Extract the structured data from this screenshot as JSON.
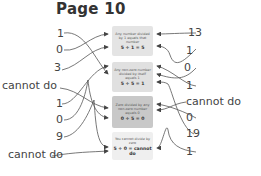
{
  "title": "Page 10",
  "boxes": [
    {
      "rule": "Any number divided by 1 equals that number",
      "equation": "5 ÷ 1 = 5",
      "color": "#e4e4e4"
    },
    {
      "rule": "Any non-zero number divided by itself equals 1",
      "equation": "5 ÷ 5 = 1",
      "color": "#e0e0e0"
    },
    {
      "rule": "Zero divided by any non-zero number equals 0",
      "equation": "0 ÷ 5 = 0",
      "color": "#c8c8c8"
    },
    {
      "rule": "You cannot divide by zero",
      "equation": "5 ÷ 0 = cannot do",
      "color": "#efefef"
    }
  ],
  "left_labels": [
    "1",
    "0",
    "3",
    "cannot do",
    "1",
    "0",
    "9",
    "cannot do"
  ],
  "right_labels": [
    "13",
    "1",
    "0",
    "1",
    "cannot do",
    "0",
    "19",
    "1"
  ]
}
